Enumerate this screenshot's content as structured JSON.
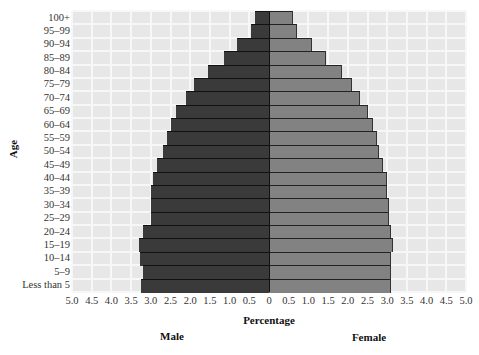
{
  "chart_data": {
    "type": "bar",
    "orientation": "horizontal-population-pyramid",
    "title": "",
    "xlabel": "Percentage",
    "ylabel": "Age",
    "xlim": [
      -5.0,
      5.0
    ],
    "x_ticks": [
      "5.0",
      "4.5",
      "4.0",
      "3.5",
      "3.0",
      "2.5",
      "2.0",
      "1.5",
      "1.0",
      "0.5",
      "0",
      "0.5",
      "1.0",
      "1.5",
      "2.0",
      "2.5",
      "3.0",
      "3.5",
      "4.0",
      "4.5",
      "5.0"
    ],
    "grid": true,
    "legend": {
      "left_label": "Male",
      "right_label": "Female",
      "position": "below-axis"
    },
    "categories": [
      "100+",
      "95–99",
      "90–94",
      "85–89",
      "80–84",
      "75–79",
      "70–74",
      "65–69",
      "60–64",
      "55–59",
      "50–54",
      "45–49",
      "40–44",
      "35–39",
      "30–34",
      "25–29",
      "20–24",
      "15–19",
      "10–14",
      "5–9",
      "Less than 5"
    ],
    "series": [
      {
        "name": "Male",
        "color": "#3a3a3a",
        "values": [
          0.35,
          0.45,
          0.8,
          1.15,
          1.55,
          1.9,
          2.1,
          2.35,
          2.5,
          2.6,
          2.7,
          2.85,
          2.95,
          3.0,
          3.0,
          3.0,
          3.2,
          3.3,
          3.28,
          3.2,
          3.25
        ]
      },
      {
        "name": "Female",
        "color": "#828282",
        "values": [
          0.6,
          0.7,
          1.1,
          1.45,
          1.85,
          2.1,
          2.3,
          2.5,
          2.65,
          2.75,
          2.8,
          2.9,
          3.0,
          3.0,
          3.05,
          3.05,
          3.1,
          3.15,
          3.1,
          3.1,
          3.1
        ]
      }
    ]
  },
  "labels": {
    "y_title": "Age",
    "x_title": "Percentage",
    "male": "Male",
    "female": "Female"
  },
  "colors": {
    "plot_background": "#e7e7e7",
    "grid": "#f7f7f7",
    "male": "#3a3a3a",
    "female": "#828282"
  }
}
